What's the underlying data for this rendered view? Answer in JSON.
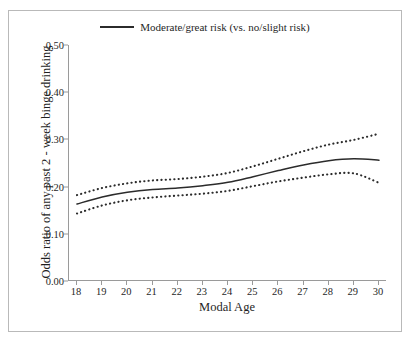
{
  "figure": {
    "background_color": "#ffffff",
    "frame_color": "#b9b9b9",
    "line_color": "#2b2b2b"
  },
  "legend": {
    "label": "Moderate/great risk (vs. no/slight risk)",
    "swatch_name": "solid-line-swatch",
    "position": "top-center"
  },
  "axes": {
    "x": {
      "label": "Modal Age",
      "ticks": [
        "18",
        "19",
        "20",
        "21",
        "22",
        "23",
        "24",
        "25",
        "26",
        "27",
        "28",
        "29",
        "30"
      ],
      "range": [
        18,
        30
      ]
    },
    "y": {
      "label": "Odds ratio of any past 2 - week binge drinking",
      "ticks": [
        "0.00",
        "0.10",
        "0.20",
        "0.30",
        "0.40",
        "0.50"
      ],
      "range": [
        0.0,
        0.5
      ]
    }
  },
  "chart_data": {
    "type": "line",
    "title": "",
    "subtitle": "",
    "xlabel": "Modal Age",
    "ylabel": "Odds ratio of any past 2 - week binge drinking",
    "xlim": [
      18,
      30
    ],
    "ylim": [
      0.0,
      0.5
    ],
    "grid": false,
    "legend_position": "top-center",
    "x": [
      18,
      19,
      20,
      21,
      22,
      23,
      24,
      25,
      26,
      27,
      28,
      29,
      30
    ],
    "series": [
      {
        "name": "Moderate/great risk (vs. no/slight risk)",
        "style": "solid",
        "color": "#2b2b2b",
        "values": [
          0.163,
          0.178,
          0.188,
          0.194,
          0.197,
          0.202,
          0.209,
          0.221,
          0.234,
          0.246,
          0.255,
          0.259,
          0.256
        ]
      },
      {
        "name": "Upper 95% confidence limit",
        "style": "dotted",
        "color": "#2b2b2b",
        "values": [
          0.182,
          0.197,
          0.207,
          0.213,
          0.216,
          0.221,
          0.229,
          0.243,
          0.259,
          0.275,
          0.289,
          0.299,
          0.312
        ]
      },
      {
        "name": "Lower 95% confidence limit",
        "style": "dotted",
        "color": "#2b2b2b",
        "values": [
          0.143,
          0.16,
          0.171,
          0.177,
          0.181,
          0.185,
          0.191,
          0.201,
          0.211,
          0.219,
          0.226,
          0.228,
          0.208
        ]
      }
    ],
    "annotations": []
  }
}
